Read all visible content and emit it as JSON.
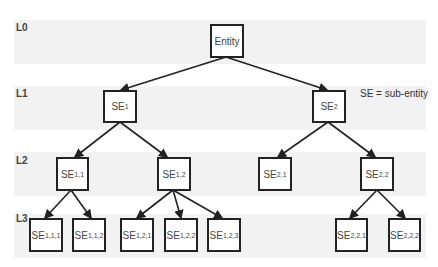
{
  "levels": [
    "L0",
    "L1",
    "L2",
    "L3"
  ],
  "legend": "SE = sub-entity",
  "nodes": {
    "root": {
      "base": "Entity",
      "sub": ""
    },
    "se1": {
      "base": "SE",
      "sub": "1"
    },
    "se2": {
      "base": "SE",
      "sub": "2"
    },
    "se11": {
      "base": "SE",
      "sub": "1,1"
    },
    "se12": {
      "base": "SE",
      "sub": "1,2"
    },
    "se21": {
      "base": "SE",
      "sub": "2,1"
    },
    "se22": {
      "base": "SE",
      "sub": "2,2"
    },
    "se111": {
      "base": "SE",
      "sub": "1,1,1"
    },
    "se112": {
      "base": "SE",
      "sub": "1,1,2"
    },
    "se121": {
      "base": "SE",
      "sub": "1,2,1"
    },
    "se122": {
      "base": "SE",
      "sub": "1,2,2"
    },
    "se123": {
      "base": "SE",
      "sub": "1,2,3"
    },
    "se221": {
      "base": "SE",
      "sub": "2,2,1"
    },
    "se222": {
      "base": "SE",
      "sub": "2,2,2"
    }
  },
  "edges": [
    [
      "root",
      "se1"
    ],
    [
      "root",
      "se2"
    ],
    [
      "se1",
      "se11"
    ],
    [
      "se1",
      "se12"
    ],
    [
      "se2",
      "se21"
    ],
    [
      "se2",
      "se22"
    ],
    [
      "se11",
      "se111"
    ],
    [
      "se11",
      "se112"
    ],
    [
      "se12",
      "se121"
    ],
    [
      "se12",
      "se122"
    ],
    [
      "se12",
      "se123"
    ],
    [
      "se22",
      "se221"
    ],
    [
      "se22",
      "se222"
    ]
  ]
}
